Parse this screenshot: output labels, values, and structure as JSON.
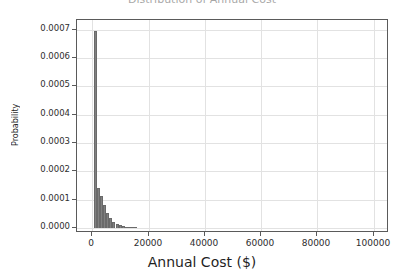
{
  "figure": {
    "width": 404,
    "height": 277,
    "background": "#ffffff",
    "title_remnant": "Distribution of Annual Cost"
  },
  "chart_data": {
    "type": "bar",
    "title": "",
    "xlabel": "Annual Cost ($)",
    "ylabel": "Probability",
    "xlim": [
      -5500,
      105500
    ],
    "ylim": [
      -1.85e-05,
      0.000735
    ],
    "grid": true,
    "legend": null,
    "bar_color": "#808080",
    "edge_color": "#6a6a6a",
    "grid_color": "#e2e2e2",
    "axis_color": "#5a5a5a",
    "xticks": [
      0,
      20000,
      40000,
      60000,
      80000,
      100000
    ],
    "xticklabels": [
      "0",
      "20000",
      "40000",
      "60000",
      "80000",
      "100000"
    ],
    "yticks": [
      0.0,
      0.0001,
      0.0002,
      0.0003,
      0.0004,
      0.0005,
      0.0006,
      0.0007
    ],
    "yticklabels": [
      "0.0000",
      "0.0001",
      "0.0002",
      "0.0003",
      "0.0004",
      "0.0005",
      "0.0006",
      "0.0007"
    ],
    "bin_width": 1100,
    "bin_lefts": [
      500,
      1600,
      2700,
      3800,
      4900,
      6000,
      7100,
      8200,
      9300,
      10400,
      11500,
      12600,
      13700,
      14800,
      15900,
      17000,
      18100,
      19200,
      20300,
      21400,
      22500,
      23600,
      24700,
      25800,
      26900,
      28000,
      29100,
      30200,
      31300,
      32400,
      33500,
      34600,
      35700,
      36800,
      37900,
      39000,
      40100,
      41200,
      42300,
      43400,
      44500
    ],
    "values": [
      0.000697,
      0.000142,
      0.000112,
      7.9e-05,
      5.2e-05,
      3.3e-05,
      2.05e-05,
      1.28e-05,
      8.2e-06,
      5.5e-06,
      3.8e-06,
      2.7e-06,
      2e-06,
      1.5e-06,
      1.2e-06,
      1e-06,
      8e-07,
      7e-07,
      6e-07,
      5e-07,
      4.2e-07,
      3.6e-07,
      3.1e-07,
      2.7e-07,
      2.3e-07,
      2e-07,
      1.7e-07,
      1.5e-07,
      1.3e-07,
      1.1e-07,
      1e-07,
      9e-08,
      8e-08,
      7e-08,
      6e-08,
      5e-08,
      4e-08,
      4e-08,
      3e-08,
      3e-08,
      2e-08
    ],
    "peak": {
      "x": 1050,
      "y": 0.000697
    }
  }
}
